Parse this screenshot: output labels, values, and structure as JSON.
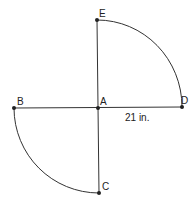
{
  "diagram": {
    "points": {
      "A": {
        "label": "A",
        "x": 98,
        "y": 108
      },
      "B": {
        "label": "B",
        "x": 14,
        "y": 108
      },
      "C": {
        "label": "C",
        "x": 99,
        "y": 193
      },
      "D": {
        "label": "D",
        "x": 182,
        "y": 107
      },
      "E": {
        "label": "E",
        "x": 97,
        "y": 20
      }
    },
    "measurement": "21 in.",
    "stroke_color": "#333333"
  }
}
